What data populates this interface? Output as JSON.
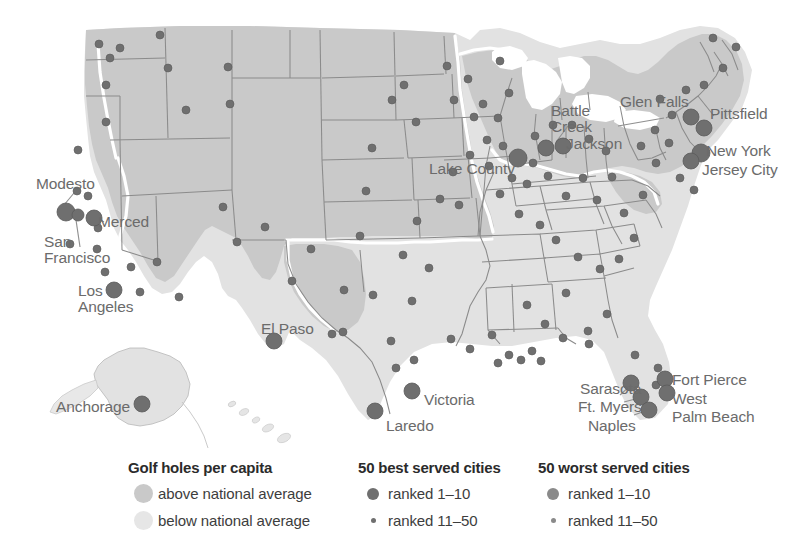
{
  "map": {
    "title": "Golf holes per capita map of the United States",
    "colors": {
      "above_average_fill": "#c9c9c9",
      "below_average_fill": "#e2e2e2",
      "state_border": "#8f8f8f",
      "region_divider": "#ffffff",
      "best_marker": "#6f6f6f",
      "worst_marker": "#8a8a8a",
      "label_text": "#6b6b6b",
      "background": "#ffffff"
    },
    "labels": [
      {
        "name": "Modesto",
        "x": 36,
        "y": 176,
        "anchor": "start"
      },
      {
        "name": "Merced",
        "x": 98,
        "y": 214,
        "anchor": "start"
      },
      {
        "name": "San\nFrancisco",
        "x": 44,
        "y": 234,
        "anchor": "start"
      },
      {
        "name": "Los\nAngeles",
        "x": 78,
        "y": 283,
        "anchor": "start"
      },
      {
        "name": "Anchorage",
        "x": 56,
        "y": 399,
        "anchor": "start"
      },
      {
        "name": "El Paso",
        "x": 261,
        "y": 321,
        "anchor": "start"
      },
      {
        "name": "Laredo",
        "x": 386,
        "y": 418,
        "anchor": "start"
      },
      {
        "name": "Victoria",
        "x": 424,
        "y": 392,
        "anchor": "start"
      },
      {
        "name": "Lake County",
        "x": 429,
        "y": 161,
        "anchor": "start"
      },
      {
        "name": "Battle\nCreek",
        "x": 551,
        "y": 103,
        "anchor": "start"
      },
      {
        "name": "Jackson",
        "x": 566,
        "y": 136,
        "anchor": "start"
      },
      {
        "name": "Glen Falls",
        "x": 620,
        "y": 94,
        "anchor": "start"
      },
      {
        "name": "Pittsfield",
        "x": 710,
        "y": 106,
        "anchor": "start"
      },
      {
        "name": "New York",
        "x": 706,
        "y": 143,
        "anchor": "start"
      },
      {
        "name": "Jersey City",
        "x": 702,
        "y": 162,
        "anchor": "start"
      },
      {
        "name": "Sarasota",
        "x": 580,
        "y": 381,
        "anchor": "start"
      },
      {
        "name": "Ft. Myers",
        "x": 578,
        "y": 399,
        "anchor": "start"
      },
      {
        "name": "Naples",
        "x": 588,
        "y": 418,
        "anchor": "start"
      },
      {
        "name": "Fort Pierce",
        "x": 672,
        "y": 372,
        "anchor": "start"
      },
      {
        "name": "West",
        "x": 672,
        "y": 391,
        "anchor": "start"
      },
      {
        "name": "Palm Beach",
        "x": 672,
        "y": 409,
        "anchor": "start"
      }
    ]
  },
  "legend": {
    "area": {
      "title": "Golf holes per capita",
      "items": [
        {
          "label": "above national average",
          "swatch": "above-average-swatch",
          "color": "#c9c9c9"
        },
        {
          "label": "below national average",
          "swatch": "below-average-swatch",
          "color": "#e6e6e6"
        }
      ]
    },
    "best": {
      "title": "50 best served cities",
      "items": [
        {
          "label": "ranked 1–10",
          "swatch": "large-dot",
          "color": "#6f6f6f"
        },
        {
          "label": "ranked 11–50",
          "swatch": "small-dot",
          "color": "#6f6f6f"
        }
      ]
    },
    "worst": {
      "title": "50 worst served cities",
      "items": [
        {
          "label": "ranked 1–10",
          "swatch": "large-dot",
          "color": "#8a8a8a"
        },
        {
          "label": "ranked 11–50",
          "swatch": "small-dot",
          "color": "#8a8a8a"
        }
      ]
    }
  },
  "chart_data": {
    "type": "map",
    "title": "Golf holes per capita",
    "regions": [
      {
        "class": "above national average",
        "fill": "#c9c9c9"
      },
      {
        "class": "below national average",
        "fill": "#e2e2e2"
      }
    ],
    "markers_best_large": [
      {
        "city": "Modesto",
        "x": 66,
        "y": 212,
        "r": 9
      },
      {
        "city": "Merced",
        "x": 94,
        "y": 218,
        "r": 8
      },
      {
        "city": "San Francisco",
        "x": 78,
        "y": 215,
        "r": 6
      },
      {
        "city": "Los Angeles",
        "x": 114,
        "y": 290,
        "r": 8
      },
      {
        "city": "Anchorage",
        "x": 142,
        "y": 404,
        "r": 8
      },
      {
        "city": "El Paso",
        "x": 274,
        "y": 341,
        "r": 8
      },
      {
        "city": "Laredo",
        "x": 375,
        "y": 411,
        "r": 8
      },
      {
        "city": "Victoria",
        "x": 412,
        "y": 391,
        "r": 8
      },
      {
        "city": "Lake County",
        "x": 518,
        "y": 158,
        "r": 9
      },
      {
        "city": "Battle Creek",
        "x": 546,
        "y": 148,
        "r": 8
      },
      {
        "city": "Jackson",
        "x": 563,
        "y": 146,
        "r": 8
      },
      {
        "city": "Glen Falls",
        "x": 691,
        "y": 117,
        "r": 8
      },
      {
        "city": "Pittsfield",
        "x": 704,
        "y": 128,
        "r": 8
      },
      {
        "city": "New York",
        "x": 701,
        "y": 153,
        "r": 9
      },
      {
        "city": "Jersey City",
        "x": 691,
        "y": 161,
        "r": 8
      },
      {
        "city": "Sarasota",
        "x": 631,
        "y": 383,
        "r": 8
      },
      {
        "city": "Ft. Myers",
        "x": 641,
        "y": 397,
        "r": 8
      },
      {
        "city": "Naples",
        "x": 649,
        "y": 410,
        "r": 8
      },
      {
        "city": "Fort Pierce",
        "x": 665,
        "y": 379,
        "r": 8
      },
      {
        "city": "West Palm Beach",
        "x": 667,
        "y": 393,
        "r": 8
      }
    ],
    "markers_small": [
      {
        "x": 160,
        "y": 35,
        "r": 4
      },
      {
        "x": 110,
        "y": 58,
        "r": 4
      },
      {
        "x": 120,
        "y": 48,
        "r": 4
      },
      {
        "x": 168,
        "y": 68,
        "r": 4
      },
      {
        "x": 106,
        "y": 85,
        "r": 4
      },
      {
        "x": 99,
        "y": 44,
        "r": 4
      },
      {
        "x": 228,
        "y": 67,
        "r": 4
      },
      {
        "x": 230,
        "y": 104,
        "r": 4
      },
      {
        "x": 186,
        "y": 110,
        "r": 4
      },
      {
        "x": 106,
        "y": 122,
        "r": 4
      },
      {
        "x": 78,
        "y": 150,
        "r": 4
      },
      {
        "x": 77,
        "y": 191,
        "r": 4
      },
      {
        "x": 88,
        "y": 196,
        "r": 4
      },
      {
        "x": 70,
        "y": 244,
        "r": 4
      },
      {
        "x": 97,
        "y": 249,
        "r": 4
      },
      {
        "x": 98,
        "y": 228,
        "r": 4
      },
      {
        "x": 105,
        "y": 272,
        "r": 4
      },
      {
        "x": 131,
        "y": 267,
        "r": 4
      },
      {
        "x": 157,
        "y": 262,
        "r": 4
      },
      {
        "x": 140,
        "y": 292,
        "r": 4
      },
      {
        "x": 179,
        "y": 297,
        "r": 4
      },
      {
        "x": 223,
        "y": 207,
        "r": 4
      },
      {
        "x": 237,
        "y": 242,
        "r": 4
      },
      {
        "x": 265,
        "y": 227,
        "r": 4
      },
      {
        "x": 292,
        "y": 281,
        "r": 4
      },
      {
        "x": 311,
        "y": 249,
        "r": 4
      },
      {
        "x": 332,
        "y": 334,
        "r": 4
      },
      {
        "x": 343,
        "y": 332,
        "r": 4
      },
      {
        "x": 360,
        "y": 236,
        "r": 4
      },
      {
        "x": 344,
        "y": 290,
        "r": 4
      },
      {
        "x": 373,
        "y": 295,
        "r": 4
      },
      {
        "x": 366,
        "y": 191,
        "r": 4
      },
      {
        "x": 372,
        "y": 148,
        "r": 4
      },
      {
        "x": 392,
        "y": 100,
        "r": 4
      },
      {
        "x": 404,
        "y": 85,
        "r": 4
      },
      {
        "x": 416,
        "y": 122,
        "r": 4
      },
      {
        "x": 447,
        "y": 66,
        "r": 4
      },
      {
        "x": 454,
        "y": 100,
        "r": 4
      },
      {
        "x": 468,
        "y": 79,
        "r": 4
      },
      {
        "x": 474,
        "y": 117,
        "r": 4
      },
      {
        "x": 500,
        "y": 61,
        "r": 4
      },
      {
        "x": 509,
        "y": 93,
        "r": 4
      },
      {
        "x": 487,
        "y": 140,
        "r": 4
      },
      {
        "x": 470,
        "y": 155,
        "r": 4
      },
      {
        "x": 453,
        "y": 172,
        "r": 4
      },
      {
        "x": 440,
        "y": 199,
        "r": 4
      },
      {
        "x": 459,
        "y": 205,
        "r": 4
      },
      {
        "x": 417,
        "y": 221,
        "r": 4
      },
      {
        "x": 403,
        "y": 255,
        "r": 4
      },
      {
        "x": 429,
        "y": 268,
        "r": 4
      },
      {
        "x": 412,
        "y": 301,
        "r": 4
      },
      {
        "x": 391,
        "y": 341,
        "r": 4
      },
      {
        "x": 414,
        "y": 360,
        "r": 4
      },
      {
        "x": 396,
        "y": 368,
        "r": 4
      },
      {
        "x": 451,
        "y": 339,
        "r": 4
      },
      {
        "x": 470,
        "y": 349,
        "r": 4
      },
      {
        "x": 492,
        "y": 335,
        "r": 4
      },
      {
        "x": 498,
        "y": 363,
        "r": 4
      },
      {
        "x": 509,
        "y": 355,
        "r": 4
      },
      {
        "x": 521,
        "y": 360,
        "r": 4
      },
      {
        "x": 532,
        "y": 351,
        "r": 4
      },
      {
        "x": 541,
        "y": 361,
        "r": 4
      },
      {
        "x": 527,
        "y": 305,
        "r": 4
      },
      {
        "x": 545,
        "y": 324,
        "r": 4
      },
      {
        "x": 566,
        "y": 293,
        "r": 4
      },
      {
        "x": 588,
        "y": 331,
        "r": 4
      },
      {
        "x": 563,
        "y": 338,
        "r": 4
      },
      {
        "x": 589,
        "y": 344,
        "r": 4
      },
      {
        "x": 607,
        "y": 314,
        "r": 4
      },
      {
        "x": 600,
        "y": 269,
        "r": 4
      },
      {
        "x": 578,
        "y": 257,
        "r": 4
      },
      {
        "x": 556,
        "y": 240,
        "r": 4
      },
      {
        "x": 540,
        "y": 225,
        "r": 4
      },
      {
        "x": 519,
        "y": 214,
        "r": 4
      },
      {
        "x": 500,
        "y": 194,
        "r": 4
      },
      {
        "x": 527,
        "y": 184,
        "r": 4
      },
      {
        "x": 548,
        "y": 176,
        "r": 4
      },
      {
        "x": 566,
        "y": 196,
        "r": 4
      },
      {
        "x": 583,
        "y": 178,
        "r": 4
      },
      {
        "x": 597,
        "y": 200,
        "r": 4
      },
      {
        "x": 612,
        "y": 177,
        "r": 4
      },
      {
        "x": 624,
        "y": 213,
        "r": 4
      },
      {
        "x": 634,
        "y": 238,
        "r": 4
      },
      {
        "x": 619,
        "y": 259,
        "r": 4
      },
      {
        "x": 643,
        "y": 195,
        "r": 4
      },
      {
        "x": 656,
        "y": 163,
        "r": 4
      },
      {
        "x": 669,
        "y": 143,
        "r": 4
      },
      {
        "x": 680,
        "y": 178,
        "r": 4
      },
      {
        "x": 694,
        "y": 190,
        "r": 4
      },
      {
        "x": 672,
        "y": 115,
        "r": 4
      },
      {
        "x": 655,
        "y": 130,
        "r": 4
      },
      {
        "x": 641,
        "y": 146,
        "r": 4
      },
      {
        "x": 660,
        "y": 99,
        "r": 4
      },
      {
        "x": 686,
        "y": 90,
        "r": 4
      },
      {
        "x": 704,
        "y": 85,
        "r": 4
      },
      {
        "x": 723,
        "y": 68,
        "r": 4
      },
      {
        "x": 736,
        "y": 47,
        "r": 4
      },
      {
        "x": 713,
        "y": 38,
        "r": 4
      },
      {
        "x": 606,
        "y": 151,
        "r": 4
      },
      {
        "x": 589,
        "y": 139,
        "r": 4
      },
      {
        "x": 572,
        "y": 125,
        "r": 4
      },
      {
        "x": 553,
        "y": 125,
        "r": 4
      },
      {
        "x": 535,
        "y": 136,
        "r": 4
      },
      {
        "x": 503,
        "y": 146,
        "r": 4
      },
      {
        "x": 489,
        "y": 166,
        "r": 4
      },
      {
        "x": 512,
        "y": 178,
        "r": 4
      },
      {
        "x": 533,
        "y": 163,
        "r": 4
      },
      {
        "x": 498,
        "y": 118,
        "r": 4
      },
      {
        "x": 483,
        "y": 104,
        "r": 4
      },
      {
        "x": 656,
        "y": 385,
        "r": 4
      },
      {
        "x": 658,
        "y": 368,
        "r": 4
      },
      {
        "x": 635,
        "y": 355,
        "r": 4
      }
    ]
  }
}
